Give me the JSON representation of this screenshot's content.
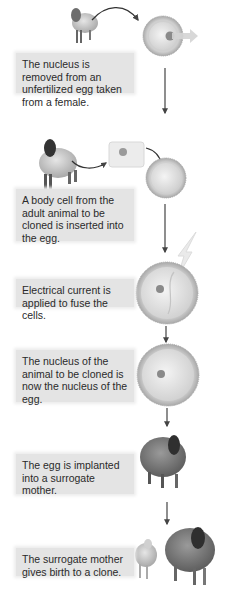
{
  "steps": [
    {
      "text": "The nucleus is removed from an unfertilized egg taken from a female."
    },
    {
      "text": "A body cell from the adult animal to be cloned is inserted into the egg."
    },
    {
      "text": "Electrical current is applied to fuse the cells."
    },
    {
      "text": "The nucleus of the animal to be cloned is now the nucleus of the egg."
    },
    {
      "text": "The egg is implanted into a surrogate mother."
    },
    {
      "text": "The surrogate mother gives birth to a clone."
    }
  ],
  "colors": {
    "label_box": "#e4e4e4",
    "egg_membrane": "#bdbdbd",
    "egg_cytoplasm": "#e2e2e2",
    "nucleus": "#8a8a8a",
    "sheep": "#8c8c8c",
    "arrow": "#555555"
  }
}
